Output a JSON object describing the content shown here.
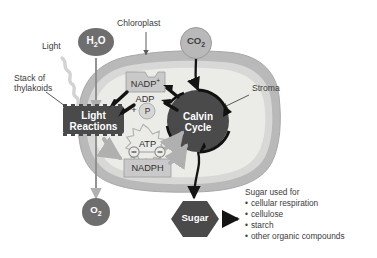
{
  "diagram": {
    "colors": {
      "envelope_outer": "#b9b9b9",
      "envelope_inner": "#d8d8d6",
      "stroma_fill": "#ebebe8",
      "dark_node": "#4a4a4a",
      "mid_node": "#6e6e6e",
      "light_box": "#c9c9c9",
      "arrow_black": "#141414",
      "arrow_gray": "#b0b0b0",
      "text_label": "#3b3b3b",
      "text_on_dark": "#ffffff",
      "light_squiggle": "#d3d3d3"
    },
    "callouts": [
      {
        "id": "chloroplast",
        "label": "Chloroplast"
      },
      {
        "id": "light",
        "label": "Light"
      },
      {
        "id": "stack-of-thylakoids",
        "label": "Stack of\nthylakoids",
        "line1": "Stack of",
        "line2": "thylakoids"
      },
      {
        "id": "stroma",
        "label": "Stroma"
      }
    ],
    "molecules": {
      "water": {
        "label": "H2O",
        "base": "H",
        "sub": "2",
        "tail": "O"
      },
      "carbon_dioxide": {
        "label": "CO2",
        "base": "CO",
        "sub": "2"
      },
      "oxygen": {
        "label": "O2",
        "base": "O",
        "sub": "2"
      }
    },
    "processes": {
      "light_reactions": {
        "line1": "Light",
        "line2": "Reactions"
      },
      "calvin_cycle": {
        "line1": "Calvin",
        "line2": "Cycle"
      }
    },
    "carriers": {
      "nadp_plus": {
        "base": "NADP",
        "sup": "+"
      },
      "adp": "ADP",
      "plus": "+",
      "phosphate": "P",
      "atp": "ATP",
      "nadph": "NADPH",
      "electron_left": "−",
      "electron_right": "−"
    },
    "product": {
      "label": "Sugar"
    },
    "uses": {
      "heading": "Sugar used for",
      "items": [
        "cellular respiration",
        "cellulose",
        "starch",
        "other organic compounds"
      ]
    }
  }
}
